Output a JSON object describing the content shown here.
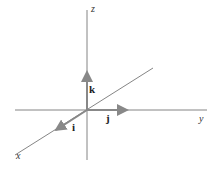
{
  "diagram": {
    "title": "",
    "axes": {
      "x": {
        "label": "x"
      },
      "y": {
        "label": "y"
      },
      "z": {
        "label": "z"
      }
    },
    "vectors": [
      {
        "name": "i",
        "label": "i",
        "direction": "x"
      },
      {
        "name": "j",
        "label": "j",
        "direction": "y"
      },
      {
        "name": "k",
        "label": "k",
        "direction": "z"
      }
    ],
    "colors": {
      "axis": "#555555",
      "vector": "#888888"
    }
  }
}
